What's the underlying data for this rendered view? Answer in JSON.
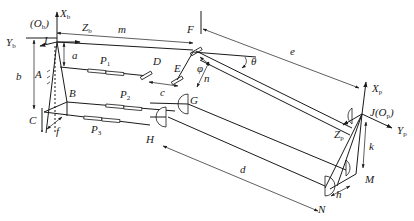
{
  "diagram": {
    "points": {
      "I": "I",
      "A": "A",
      "B": "B",
      "C": "C",
      "D": "D",
      "E": "E",
      "F": "F",
      "G": "G",
      "H": "H",
      "J": "J",
      "M": "M",
      "N": "N"
    },
    "origins": {
      "base": {
        "open": "(",
        "letter": "O",
        "sub": "b",
        "close": ")"
      },
      "platform": {
        "open": "(",
        "letter": "O",
        "sub": "p",
        "close": ")"
      }
    },
    "axes": {
      "Xb": {
        "letter": "X",
        "sub": "b"
      },
      "Yb": {
        "letter": "Y",
        "sub": "b"
      },
      "Zb": {
        "letter": "Z",
        "sub": "b"
      },
      "Xp": {
        "letter": "X",
        "sub": "p"
      },
      "Yp": {
        "letter": "Y",
        "sub": "p"
      },
      "Zp": {
        "letter": "Z",
        "sub": "p"
      }
    },
    "prismatic_joints": [
      {
        "letter": "P",
        "sub": "1"
      },
      {
        "letter": "P",
        "sub": "2"
      },
      {
        "letter": "P",
        "sub": "3"
      }
    ],
    "dimensions": {
      "a": "a",
      "b": "b",
      "c": "c",
      "d": "d",
      "e": "e",
      "f": "f",
      "h": "h",
      "k": "k",
      "m": "m",
      "n": "n"
    },
    "angles": {
      "phi": "φ",
      "theta": "θ"
    }
  }
}
